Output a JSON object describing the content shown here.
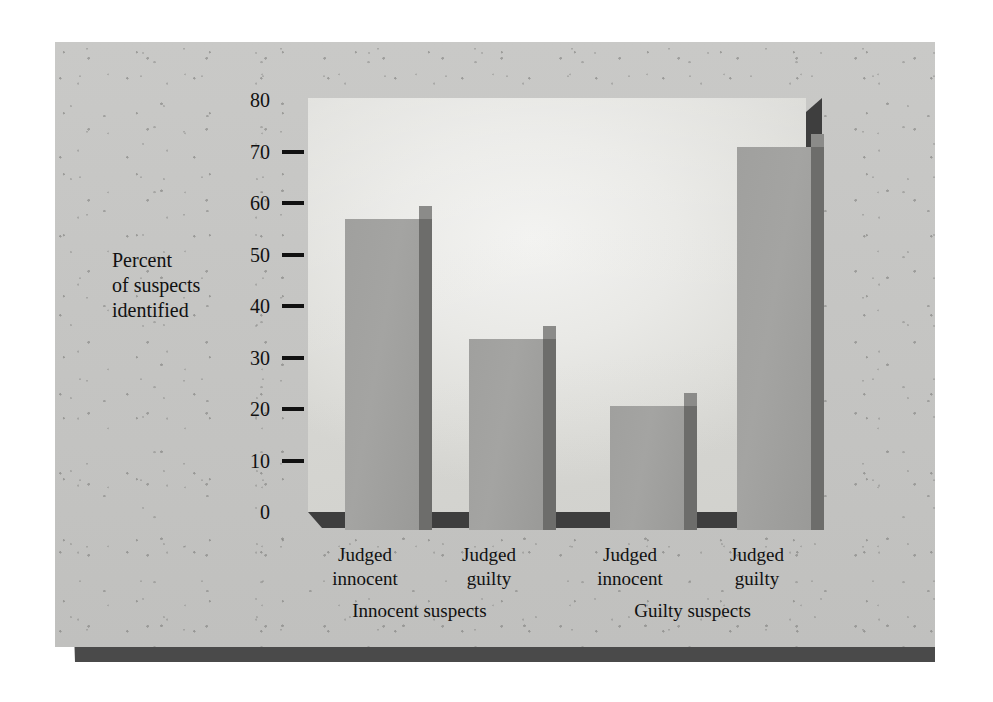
{
  "chart_data": {
    "type": "bar",
    "title": "",
    "subtitle": "",
    "xlabel": "",
    "ylabel": "Percent of suspects identified",
    "ylabel_lines": [
      "Percent",
      "of suspects",
      "identified"
    ],
    "ylim": [
      0,
      80
    ],
    "grid": false,
    "legend": "none",
    "y_ticks": [
      0,
      10,
      20,
      30,
      40,
      50,
      60,
      70,
      80
    ],
    "y_tick_labels": [
      "0",
      "10",
      "20",
      "30",
      "40",
      "50",
      "60",
      "70",
      "80"
    ],
    "y_ticks_with_marks": [
      10,
      20,
      30,
      40,
      50,
      60,
      70
    ],
    "categories": [
      "Judged innocent",
      "Judged guilty",
      "Judged innocent",
      "Judged guilty"
    ],
    "category_lines": [
      [
        "Judged",
        "innocent"
      ],
      [
        "Judged",
        "guilty"
      ],
      [
        "Judged",
        "innocent"
      ],
      [
        "Judged",
        "guilty"
      ]
    ],
    "values": [
      60,
      37,
      24,
      74
    ],
    "groups": [
      {
        "label": "Innocent suspects",
        "categories": [
          "Judged innocent",
          "Judged guilty"
        ],
        "values": [
          60,
          37
        ]
      },
      {
        "label": "Guilty suspects",
        "categories": [
          "Judged innocent",
          "Judged guilty"
        ],
        "values": [
          24,
          74
        ]
      }
    ],
    "group_labels": [
      "Innocent suspects",
      "Guilty suspects"
    ],
    "colors": {
      "bar_face": "#a0a09e",
      "bar_side": "#6d6d6b",
      "bar_top": "#8b8b89",
      "panel": "#e9e9e6",
      "board": "#c6c6c4",
      "axis": "#111111",
      "floor": "#3e3e3e"
    }
  },
  "axis": {
    "y_title_line1": "Percent",
    "y_title_line2": "of suspects",
    "y_title_line3": "identified",
    "tick_80": "80",
    "tick_70": "70",
    "tick_60": "60",
    "tick_50": "50",
    "tick_40": "40",
    "tick_30": "30",
    "tick_20": "20",
    "tick_10": "10",
    "tick_0": "0"
  },
  "xlabels": {
    "b1_line1": "Judged",
    "b1_line2": "innocent",
    "b2_line1": "Judged",
    "b2_line2": "guilty",
    "b3_line1": "Judged",
    "b3_line2": "innocent",
    "b4_line1": "Judged",
    "b4_line2": "guilty",
    "group1": "Innocent suspects",
    "group2": "Guilty suspects"
  }
}
